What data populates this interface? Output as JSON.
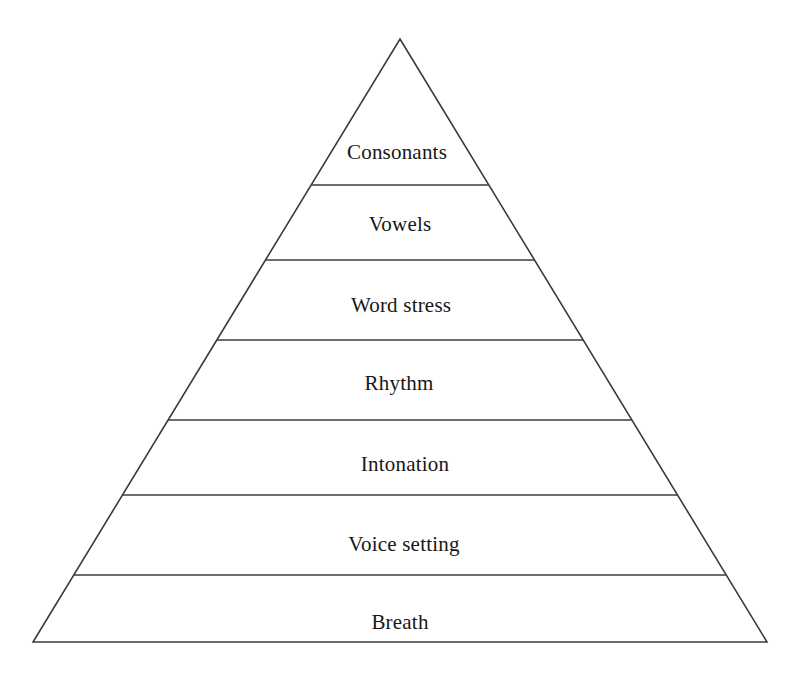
{
  "diagram": {
    "type": "pyramid",
    "title": "",
    "background_color": "#ffffff",
    "stroke_color": "#3b3b3b",
    "stroke_width": 1.6,
    "text_color": "#171717",
    "apex": {
      "x": 400,
      "y": 39
    },
    "base": {
      "left_x": 33,
      "right_x": 767,
      "y": 642
    },
    "levels": [
      {
        "index": 1,
        "label": "Consonants",
        "top_y": 39,
        "bottom_y": 185,
        "label_x": 397,
        "label_y": 152
      },
      {
        "index": 2,
        "label": "Vowels",
        "top_y": 185,
        "bottom_y": 260,
        "label_x": 400,
        "label_y": 224
      },
      {
        "index": 3,
        "label": "Word stress",
        "top_y": 260,
        "bottom_y": 340,
        "label_x": 401,
        "label_y": 305
      },
      {
        "index": 4,
        "label": "Rhythm",
        "top_y": 340,
        "bottom_y": 420,
        "label_x": 399,
        "label_y": 383
      },
      {
        "index": 5,
        "label": "Intonation",
        "top_y": 420,
        "bottom_y": 495,
        "label_x": 405,
        "label_y": 464
      },
      {
        "index": 6,
        "label": "Voice setting",
        "top_y": 495,
        "bottom_y": 575,
        "label_x": 404,
        "label_y": 544
      },
      {
        "index": 7,
        "label": "Breath",
        "top_y": 575,
        "bottom_y": 642,
        "label_x": 400,
        "label_y": 622
      }
    ]
  }
}
